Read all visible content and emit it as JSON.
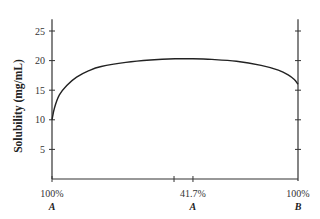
{
  "chart_data": {
    "type": "line",
    "title": "",
    "ylabel": "Solubility (mg/mL)",
    "xlabel": "",
    "ylim": [
      0,
      27
    ],
    "xlim": [
      0,
      1
    ],
    "y_ticks": [
      5,
      10,
      15,
      20,
      25
    ],
    "y_tick_labels": [
      "5",
      "10",
      "15",
      "20",
      "25"
    ],
    "x_ticks": [
      {
        "x": 0,
        "label": "100%",
        "sublabel": "A"
      },
      {
        "x": 0.496,
        "label": "",
        "sublabel": ""
      },
      {
        "x": 0.573,
        "label": "41.7%",
        "sublabel": "A"
      },
      {
        "x": 1,
        "label": "100%",
        "sublabel": "B"
      }
    ],
    "grid": false,
    "series": [
      {
        "name": "Solubility",
        "x": [
          0,
          0.01,
          0.03,
          0.06,
          0.1,
          0.15,
          0.2,
          0.3,
          0.4,
          0.5,
          0.573,
          0.65,
          0.75,
          0.85,
          0.92,
          0.96,
          0.985,
          1.0
        ],
        "y": [
          10,
          12.0,
          14.2,
          15.8,
          17.2,
          18.3,
          19.0,
          19.7,
          20.1,
          20.3,
          20.3,
          20.2,
          19.9,
          19.2,
          18.4,
          17.6,
          16.8,
          16.0
        ]
      }
    ]
  }
}
